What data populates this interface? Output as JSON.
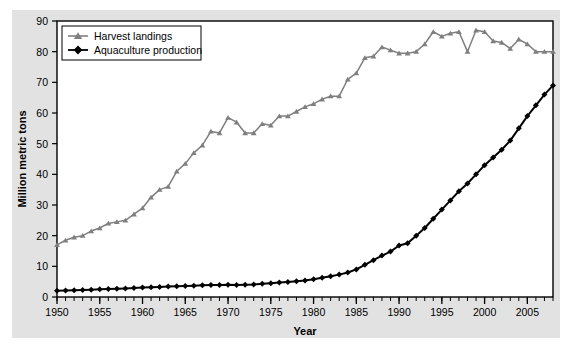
{
  "chart_data": {
    "type": "line",
    "title": "",
    "xlabel": "Year",
    "ylabel": "Million metric tons",
    "xlim": [
      1950,
      2008
    ],
    "ylim": [
      0,
      90
    ],
    "ytick_step": 10,
    "xtick_major_step": 5,
    "xtick_minor_step": 1,
    "grid": false,
    "legend_position": "top-left",
    "yticks": [
      "0",
      "10",
      "20",
      "30",
      "40",
      "50",
      "60",
      "70",
      "80",
      "90"
    ],
    "xticks": [
      "1950",
      "1955",
      "1960",
      "1965",
      "1970",
      "1975",
      "1980",
      "1985",
      "1990",
      "1995",
      "2000",
      "2005"
    ],
    "x": [
      1950,
      1951,
      1952,
      1953,
      1954,
      1955,
      1956,
      1957,
      1958,
      1959,
      1960,
      1961,
      1962,
      1963,
      1964,
      1965,
      1966,
      1967,
      1968,
      1969,
      1970,
      1971,
      1972,
      1973,
      1974,
      1975,
      1976,
      1977,
      1978,
      1979,
      1980,
      1981,
      1982,
      1983,
      1984,
      1985,
      1986,
      1987,
      1988,
      1989,
      1990,
      1991,
      1992,
      1993,
      1994,
      1995,
      1996,
      1997,
      1998,
      1999,
      2000,
      2001,
      2002,
      2003,
      2004,
      2005,
      2006,
      2007,
      2008
    ],
    "series": [
      {
        "name": "Harvest landings",
        "color": "#7f7f7f",
        "marker": "triangle",
        "values": [
          17.0,
          18.5,
          19.5,
          20.0,
          21.5,
          22.5,
          24.0,
          24.5,
          25.0,
          27.0,
          29.0,
          32.5,
          35.0,
          36.0,
          41.0,
          43.5,
          47.0,
          49.5,
          54.0,
          53.5,
          58.5,
          57.0,
          53.5,
          53.5,
          56.5,
          56.0,
          59.0,
          59.0,
          60.5,
          62.0,
          63.0,
          64.5,
          65.5,
          65.5,
          71.0,
          73.0,
          78.0,
          78.5,
          81.5,
          80.5,
          79.5,
          79.5,
          80.0,
          82.5,
          86.5,
          85.0,
          86.0,
          86.5,
          80.0,
          87.0,
          86.5,
          83.5,
          83.0,
          81.0,
          84.0,
          82.5,
          80.0,
          80.0,
          80.0
        ]
      },
      {
        "name": "Aquaculture production",
        "color": "#000000",
        "marker": "diamond",
        "values": [
          2.0,
          2.1,
          2.2,
          2.3,
          2.4,
          2.5,
          2.6,
          2.7,
          2.8,
          2.9,
          3.1,
          3.2,
          3.3,
          3.4,
          3.5,
          3.6,
          3.7,
          3.8,
          3.9,
          3.9,
          4.0,
          3.9,
          4.0,
          4.1,
          4.3,
          4.5,
          4.7,
          4.9,
          5.1,
          5.4,
          5.8,
          6.3,
          6.8,
          7.3,
          8.0,
          9.0,
          10.5,
          12.0,
          13.5,
          14.8,
          16.8,
          17.5,
          20.0,
          22.5,
          25.5,
          28.5,
          31.5,
          34.5,
          37.0,
          40.0,
          43.0,
          45.5,
          48.0,
          51.0,
          55.0,
          59.0,
          62.5,
          66.0,
          69.0
        ]
      }
    ]
  },
  "legend": {
    "items": [
      {
        "label": "Harvest landings"
      },
      {
        "label": "Aquaculture production"
      }
    ]
  }
}
